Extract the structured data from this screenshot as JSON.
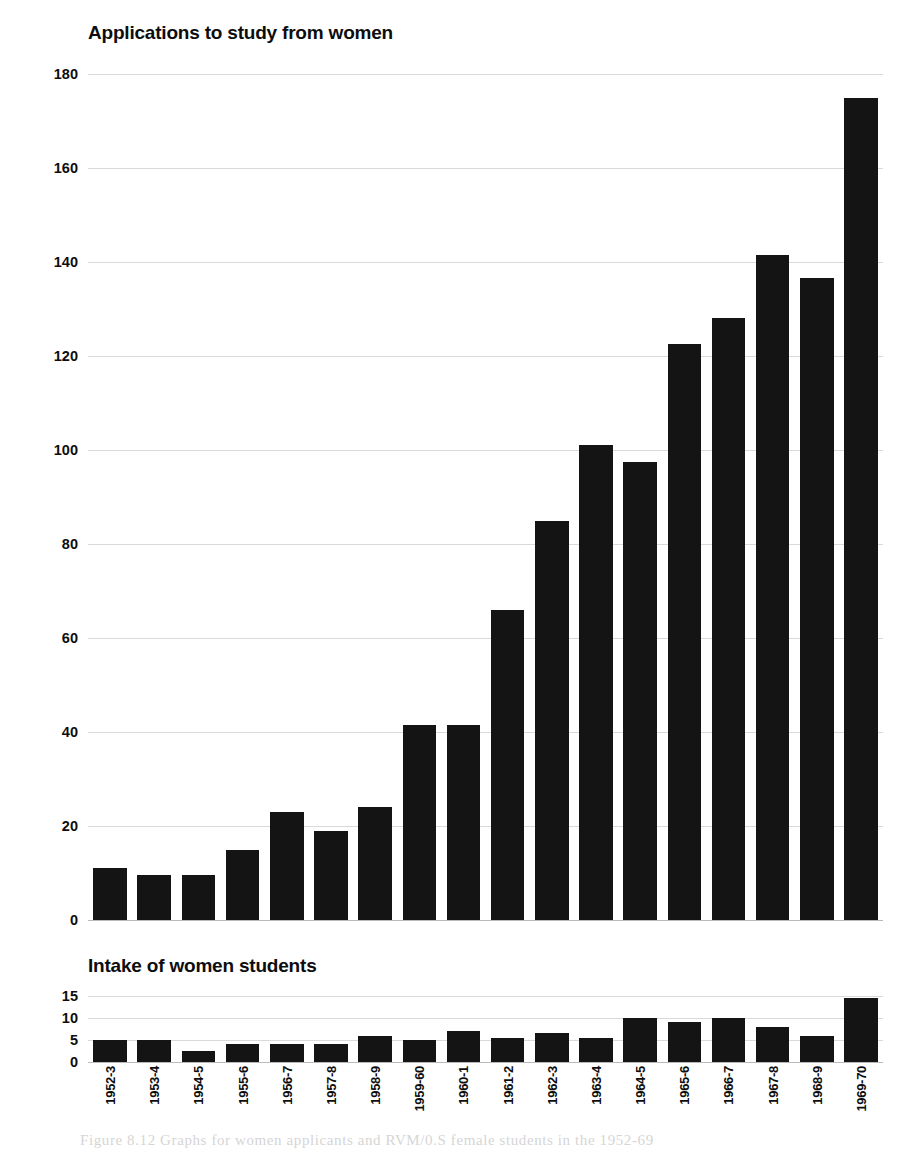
{
  "page": {
    "background_color": "#ffffff",
    "ink_color": "#141414",
    "gridline_color": "#d9d9d9"
  },
  "caption": "Figure 8.12   Graphs for women applicants and RVM/0.S female students in the 1952-69",
  "chart_data": [
    {
      "id": "applications",
      "type": "bar",
      "title": "Applications to study from women",
      "xlabel": "",
      "ylabel": "",
      "ylim": [
        0,
        180
      ],
      "ytick_values": [
        0,
        20,
        40,
        60,
        80,
        100,
        120,
        140,
        160,
        180
      ],
      "ytick_labels": [
        "0",
        "20",
        "40",
        "60",
        "80",
        "100",
        "120",
        "140",
        "160",
        "180"
      ],
      "grid": true,
      "legend": "none",
      "bar_color": "#141414",
      "categories": [
        "1952-3",
        "1953-4",
        "1954-5",
        "1955-6",
        "1956-7",
        "1957-8",
        "1958-9",
        "1959-60",
        "1960-1",
        "1961-2",
        "1962-3",
        "1963-4",
        "1964-5",
        "1965-6",
        "1966-7",
        "1967-8",
        "1968-9",
        "1969-70"
      ],
      "values": [
        11,
        9.5,
        9.5,
        15,
        23,
        19,
        24,
        41.5,
        41.5,
        66,
        85,
        101,
        97.5,
        122.5,
        128,
        141.5,
        136.5,
        175
      ]
    },
    {
      "id": "intake",
      "type": "bar",
      "title": "Intake of women students",
      "xlabel": "",
      "ylabel": "",
      "ylim": [
        0,
        15
      ],
      "ytick_values": [
        0,
        5,
        10,
        15
      ],
      "ytick_labels": [
        "0",
        "5",
        "10",
        "15"
      ],
      "grid": true,
      "legend": "none",
      "bar_color": "#141414",
      "categories": [
        "1952-3",
        "1953-4",
        "1954-5",
        "1955-6",
        "1956-7",
        "1957-8",
        "1958-9",
        "1959-60",
        "1960-1",
        "1961-2",
        "1962-3",
        "1963-4",
        "1964-5",
        "1965-6",
        "1966-7",
        "1967-8",
        "1968-9",
        "1969-70"
      ],
      "values": [
        5,
        5,
        2.5,
        4,
        4,
        4,
        6,
        5,
        7,
        5.5,
        6.5,
        5.5,
        10,
        9,
        10,
        8,
        6,
        14.5
      ]
    }
  ]
}
